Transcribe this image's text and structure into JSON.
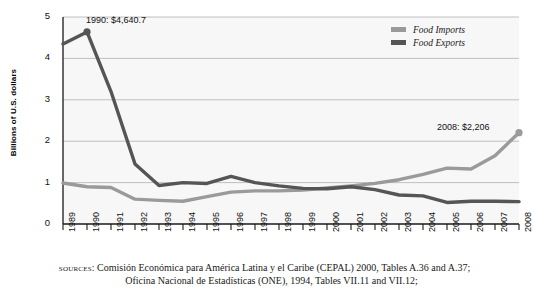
{
  "chart_data": {
    "type": "line",
    "title": "",
    "xlabel": "",
    "ylabel": "Billions of U.S. dollars",
    "ylim": [
      0,
      5
    ],
    "yticks": [
      0,
      1,
      2,
      3,
      4,
      5
    ],
    "ytick_labels": [
      "0",
      "1",
      "2",
      "3",
      "4",
      "5"
    ],
    "grid": "horizontal",
    "legend_position": "top-right",
    "categories": [
      "1989",
      "1990",
      "1991",
      "1992",
      "1993",
      "1994",
      "1995",
      "1996",
      "1997",
      "1998",
      "1999",
      "2000",
      "2001",
      "2002",
      "2003",
      "2004",
      "2005",
      "2006",
      "2007",
      "2008"
    ],
    "series": [
      {
        "name": "Food Imports",
        "color": "#9a9a9a",
        "values": [
          0.99,
          0.9,
          0.88,
          0.6,
          0.57,
          0.55,
          0.66,
          0.77,
          0.8,
          0.8,
          0.82,
          0.87,
          0.92,
          0.98,
          1.07,
          1.2,
          1.35,
          1.33,
          1.65,
          2.206
        ]
      },
      {
        "name": "Food Exports",
        "color": "#555555",
        "values": [
          4.35,
          4.64,
          3.2,
          1.45,
          0.93,
          1.0,
          0.98,
          1.15,
          1.0,
          0.92,
          0.86,
          0.85,
          0.9,
          0.83,
          0.7,
          0.68,
          0.52,
          0.55,
          0.55,
          0.54
        ]
      }
    ],
    "annotations": [
      {
        "id": "peak",
        "label": "1990: $4,640.7",
        "year": "1990",
        "value": 4.6407
      },
      {
        "id": "last-import",
        "label": "2008: $2,206",
        "year": "2008",
        "value": 2.206
      }
    ]
  },
  "legend": {
    "items": [
      {
        "label": "Food Imports",
        "color": "#9a9a9a"
      },
      {
        "label": "Food Exports",
        "color": "#555555"
      }
    ]
  },
  "sources": {
    "kicker": "sources:",
    "line1": "Comisión Económica para América Latina y el Caribe (CEPAL) 2000, Tables A.36 and A.37;",
    "line2": "Oficina Nacional de Estadísticas (ONE), 1994, Tables VII.11 and VII.12;"
  },
  "colors": {
    "plot_background": "#f7f7f7",
    "gridline": "#b9b9b9",
    "axis": "#1a1a1a",
    "imports": "#9a9a9a",
    "exports": "#555555"
  }
}
